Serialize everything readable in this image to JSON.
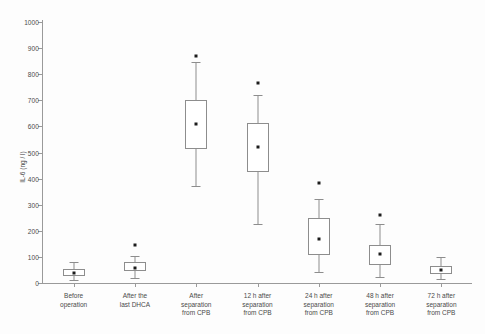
{
  "chart_data": {
    "type": "box",
    "title": "",
    "xlabel": "",
    "ylabel": "IL-6 (ng / l)",
    "ylim": [
      0,
      1000
    ],
    "ytick_step": 100,
    "yticks": [
      0,
      100,
      200,
      300,
      400,
      500,
      600,
      700,
      800,
      900,
      1000
    ],
    "grid": false,
    "legend": null,
    "categories": [
      "Before operation",
      "After the last DHCA",
      "After separation from CPB",
      "12 h after separation from CPB",
      "24 h after separation from CPB",
      "48 h after separation from CPB",
      "72 h after separation from CPB"
    ],
    "category_label_lines": [
      [
        "Before",
        "operation"
      ],
      [
        "After the",
        "last DHCA"
      ],
      [
        "After",
        "separation",
        "from CPB"
      ],
      [
        "12 h after",
        "separation",
        "from CPB"
      ],
      [
        "24 h after",
        "separation",
        "from CPB"
      ],
      [
        "48 h after",
        "separation",
        "from CPB"
      ],
      [
        "72 h after",
        "separation",
        "from CPB"
      ]
    ],
    "boxes": [
      {
        "category": "Before operation",
        "whisker_low": 10,
        "q1": 25,
        "median": 38,
        "q3": 55,
        "whisker_high": 80,
        "outliers": []
      },
      {
        "category": "After the last DHCA",
        "whisker_low": 18,
        "q1": 45,
        "median": 58,
        "q3": 82,
        "whisker_high": 105,
        "outliers": [
          145
        ]
      },
      {
        "category": "After separation from CPB",
        "whisker_low": 370,
        "q1": 515,
        "median": 608,
        "q3": 700,
        "whisker_high": 845,
        "outliers": [
          870
        ]
      },
      {
        "category": "12 h after separation from CPB",
        "whisker_low": 225,
        "q1": 425,
        "median": 522,
        "q3": 612,
        "whisker_high": 720,
        "outliers": [
          765
        ]
      },
      {
        "category": "24 h after separation from CPB",
        "whisker_low": 42,
        "q1": 108,
        "median": 168,
        "q3": 250,
        "whisker_high": 320,
        "outliers": [
          385
        ]
      },
      {
        "category": "48 h after separation from CPB",
        "whisker_low": 22,
        "q1": 68,
        "median": 110,
        "q3": 145,
        "whisker_high": 225,
        "outliers": [
          262
        ]
      },
      {
        "category": "72 h after separation from CPB",
        "whisker_low": 15,
        "q1": 35,
        "median": 48,
        "q3": 65,
        "whisker_high": 100,
        "outliers": []
      }
    ],
    "colors": {
      "axis": "#9a9a9a",
      "box_stroke": "#8d8d8d",
      "box_fill": "#ffffff",
      "marker": "#1c1c1c",
      "text": "#4a4a4a",
      "background": "#fdfdfd"
    }
  }
}
